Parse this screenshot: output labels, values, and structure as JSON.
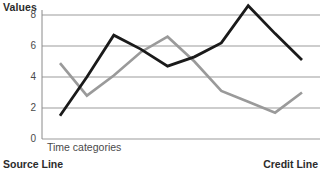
{
  "chart_data": {
    "type": "line",
    "title": "",
    "ylabel": "Values",
    "xlabel": "Time categories",
    "ylim": [
      0,
      8.8
    ],
    "yticks": [
      0,
      2,
      4,
      6,
      8
    ],
    "ytick_labels": [
      "0",
      "2",
      "4",
      "6",
      "8"
    ],
    "grid": true,
    "legend": "none",
    "x": [
      1,
      2,
      3,
      4,
      5,
      6,
      7,
      8,
      9,
      10
    ],
    "series": [
      {
        "name": "Source Line",
        "color": "#1a1a1a",
        "values": [
          1.5,
          4.0,
          6.7,
          5.8,
          4.7,
          5.3,
          6.2,
          8.6,
          6.8,
          5.1
        ]
      },
      {
        "name": "Credit Line",
        "color": "#9a9a9a",
        "values": [
          4.9,
          2.8,
          4.1,
          5.6,
          6.6,
          5.0,
          3.1,
          2.4,
          1.7,
          3.0
        ]
      }
    ]
  },
  "axes": {
    "y_title": "Values",
    "x_title": "Time categories",
    "ytick_0": "0",
    "ytick_2": "2",
    "ytick_4": "4",
    "ytick_6": "6",
    "ytick_8": "8"
  },
  "captions": {
    "left": "Source Line",
    "right": "Credit Line"
  },
  "colors": {
    "source_line": "#1a1a1a",
    "credit_line": "#9a9a9a",
    "grid": "#9b9b9b",
    "axis": "#8a8a8a",
    "text": "#3a3a3a"
  }
}
